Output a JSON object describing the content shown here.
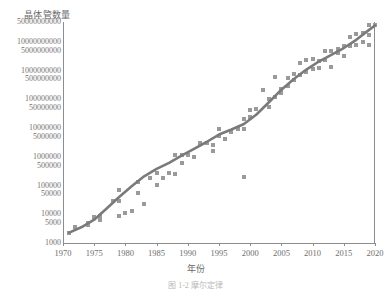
{
  "chart_data": {
    "type": "scatter",
    "title": "晶体管数量",
    "xlabel": "年份",
    "ylabel": "晶体管数量",
    "grid": false,
    "legend": "none",
    "yscale": "log",
    "xlim": [
      1970,
      2020
    ],
    "ylim": [
      1000,
      50000000000
    ],
    "xticks": [
      1970,
      1975,
      1980,
      1985,
      1990,
      1995,
      2000,
      2005,
      2010,
      2015,
      2020
    ],
    "xticklabels": [
      "1970",
      "1975",
      "1980",
      "1985",
      "1990",
      "1995",
      "2000",
      "2005",
      "2010",
      "2015",
      "2020"
    ],
    "yticks": [
      50000000000,
      10000000000,
      5000000000,
      1000000000,
      500000000,
      100000000,
      50000000,
      10000000,
      5000000,
      1000000,
      500000,
      100000,
      50000,
      10000,
      5000,
      1000
    ],
    "yticklabels": [
      "50000000000",
      "10000000000",
      "5000000000",
      "1000000000",
      "500000000",
      "100000000",
      "50000000",
      "10000000",
      "5000000",
      "1000000",
      "500000",
      "100000",
      "50000",
      "10000",
      "5000",
      "1000"
    ],
    "series": [
      {
        "name": "晶体管数量",
        "marker": "square",
        "color": "#9a9a9a",
        "points": [
          [
            1971,
            2300
          ],
          [
            1972,
            3500
          ],
          [
            1974,
            5000
          ],
          [
            1974,
            4100
          ],
          [
            1975,
            8000
          ],
          [
            1976,
            6500
          ],
          [
            1976,
            9000
          ],
          [
            1978,
            29000
          ],
          [
            1979,
            29000
          ],
          [
            1979,
            68000
          ],
          [
            1979,
            9000
          ],
          [
            1980,
            11500
          ],
          [
            1981,
            13000
          ],
          [
            1982,
            134000
          ],
          [
            1982,
            55000
          ],
          [
            1983,
            22000
          ],
          [
            1984,
            190000
          ],
          [
            1985,
            275000
          ],
          [
            1985,
            105000
          ],
          [
            1986,
            190000
          ],
          [
            1987,
            273000
          ],
          [
            1988,
            1200000
          ],
          [
            1988,
            250000
          ],
          [
            1989,
            1180000
          ],
          [
            1989,
            600000
          ],
          [
            1990,
            1200000
          ],
          [
            1991,
            1000000
          ],
          [
            1992,
            3100000
          ],
          [
            1993,
            3100000
          ],
          [
            1994,
            2500000
          ],
          [
            1994,
            1600000
          ],
          [
            1995,
            5500000
          ],
          [
            1995,
            9300000
          ],
          [
            1996,
            4300000
          ],
          [
            1997,
            7500000
          ],
          [
            1998,
            9500000
          ],
          [
            1999,
            21000000
          ],
          [
            1999,
            9500000
          ],
          [
            1999,
            200000
          ],
          [
            2000,
            42000000
          ],
          [
            2000,
            25000000
          ],
          [
            2001,
            45000000
          ],
          [
            2002,
            220000000
          ],
          [
            2003,
            105000000
          ],
          [
            2003,
            54000000
          ],
          [
            2004,
            592000000
          ],
          [
            2004,
            125000000
          ],
          [
            2005,
            228000000
          ],
          [
            2005,
            169000000
          ],
          [
            2006,
            291000000
          ],
          [
            2006,
            582000000
          ],
          [
            2007,
            789000000
          ],
          [
            2007,
            463000000
          ],
          [
            2008,
            1900000000
          ],
          [
            2008,
            731000000
          ],
          [
            2009,
            2300000000
          ],
          [
            2009,
            904000000
          ],
          [
            2010,
            2600000000
          ],
          [
            2010,
            1170000000
          ],
          [
            2011,
            2270000000
          ],
          [
            2011,
            1200000000
          ],
          [
            2012,
            5000000000
          ],
          [
            2012,
            2400000000
          ],
          [
            2013,
            5000000000
          ],
          [
            2013,
            1400000000
          ],
          [
            2014,
            5700000000
          ],
          [
            2014,
            4300000000
          ],
          [
            2015,
            7100000000
          ],
          [
            2015,
            3200000000
          ],
          [
            2016,
            7200000000
          ],
          [
            2016,
            15000000000
          ],
          [
            2017,
            19200000000
          ],
          [
            2017,
            8000000000
          ],
          [
            2018,
            21100000000
          ],
          [
            2018,
            10000000000
          ],
          [
            2019,
            39500000000
          ],
          [
            2019,
            18000000000
          ],
          [
            2019,
            8000000000
          ],
          [
            2020,
            39000000000
          ]
        ]
      }
    ],
    "trend": {
      "name": "摩尔定律趋势线",
      "color": "#7a7a7a",
      "points": [
        [
          1971,
          2300
        ],
        [
          1973,
          3600
        ],
        [
          1975,
          6500
        ],
        [
          1977,
          16000
        ],
        [
          1979,
          40000
        ],
        [
          1981,
          95000
        ],
        [
          1983,
          210000
        ],
        [
          1985,
          380000
        ],
        [
          1987,
          620000
        ],
        [
          1989,
          1100000
        ],
        [
          1991,
          1900000
        ],
        [
          1993,
          3300000
        ],
        [
          1995,
          6000000
        ],
        [
          1997,
          9000000
        ],
        [
          1999,
          14000000
        ],
        [
          2001,
          30000000
        ],
        [
          2003,
          80000000
        ],
        [
          2005,
          220000000
        ],
        [
          2007,
          520000000
        ],
        [
          2009,
          1100000000
        ],
        [
          2011,
          2100000000
        ],
        [
          2013,
          3600000000
        ],
        [
          2015,
          6200000000
        ],
        [
          2017,
          12000000000
        ],
        [
          2019,
          26000000000
        ],
        [
          2020,
          38000000000
        ]
      ]
    }
  },
  "axes": {
    "y_title": "晶体管数量",
    "x_title": "年份"
  },
  "caption": {
    "text": "图 1-2  摩尔定律"
  }
}
